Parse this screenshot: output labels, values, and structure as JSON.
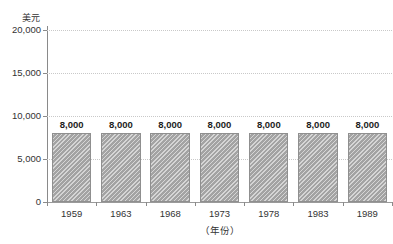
{
  "chart_data": {
    "type": "bar",
    "title": "",
    "title_clipped_note": "",
    "categories": [
      "1959",
      "1963",
      "1968",
      "1973",
      "1978",
      "1983",
      "1989"
    ],
    "values": [
      8000,
      8000,
      8000,
      8000,
      8000,
      8000,
      8000
    ],
    "value_labels": [
      "8,000",
      "8,000",
      "8,000",
      "8,000",
      "8,000",
      "8,000",
      "8,000"
    ],
    "series": [
      {
        "name": "",
        "values": [
          8000,
          8000,
          8000,
          8000,
          8000,
          8000,
          8000
        ]
      }
    ],
    "xlabel": "（年份）",
    "ylabel": "美元",
    "ylim": [
      0,
      20000
    ],
    "ytick_values": [
      0,
      5000,
      10000,
      15000,
      20000
    ],
    "ytick_labels": [
      "0",
      "5,000",
      "10,000",
      "15,000",
      "20,000"
    ],
    "grid": true,
    "grid_axis": "y",
    "grid_style": "dotted",
    "legend": false,
    "legend_position": "none",
    "bar_fill_color": "#a3a3a3",
    "bar_pattern": "diagonal-hatch",
    "bar_border_color": "#8f8f8f",
    "grid_color": "#c9c9c9",
    "axis_color": "#8a8a8a",
    "text_color": "#333333"
  },
  "axes": {
    "y_unit_caption": "美元",
    "x_axis_caption": "（年份）"
  },
  "ticks": {
    "y": [
      {
        "label": "20,000",
        "value": 20000
      },
      {
        "label": "15,000",
        "value": 15000
      },
      {
        "label": "10,000",
        "value": 10000
      },
      {
        "label": "5,000",
        "value": 5000
      },
      {
        "label": "0",
        "value": 0
      }
    ],
    "x": [
      {
        "label": "1959"
      },
      {
        "label": "1963"
      },
      {
        "label": "1968"
      },
      {
        "label": "1973"
      },
      {
        "label": "1978"
      },
      {
        "label": "1983"
      },
      {
        "label": "1989"
      }
    ]
  },
  "bars": [
    {
      "category": "1959",
      "label": "8,000",
      "value": 8000
    },
    {
      "category": "1963",
      "label": "8,000",
      "value": 8000
    },
    {
      "category": "1968",
      "label": "8,000",
      "value": 8000
    },
    {
      "category": "1973",
      "label": "8,000",
      "value": 8000
    },
    {
      "category": "1978",
      "label": "8,000",
      "value": 8000
    },
    {
      "category": "1983",
      "label": "8,000",
      "value": 8000
    },
    {
      "category": "1989",
      "label": "8,000",
      "value": 8000
    }
  ]
}
